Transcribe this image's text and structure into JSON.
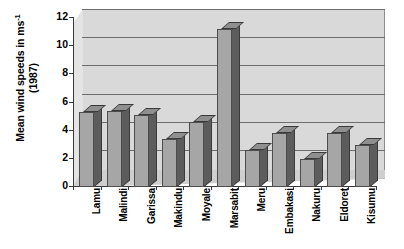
{
  "chart_data": {
    "type": "bar",
    "title": "",
    "subtitle": "",
    "xlabel": "",
    "ylabel": "Mean wind speeds in ms-1 (1987)",
    "ylabel_parts": {
      "main": "Mean wind speeds in ms",
      "superscript": "-1",
      "second_line": "(1987)"
    },
    "categories": [
      "Lamu",
      "Malindi",
      "Garissa",
      "Makindu",
      "Moyale",
      "Marsabit",
      "Meru",
      "Embakasi",
      "Nakuru",
      "Eldoret",
      "Kisumu"
    ],
    "values": [
      5.3,
      5.4,
      5.1,
      3.4,
      4.6,
      11.2,
      2.6,
      3.8,
      2.0,
      3.8,
      3.0
    ],
    "ylim": [
      0,
      12
    ],
    "ytick_values": [
      0,
      2,
      4,
      6,
      8,
      10,
      12
    ],
    "ytick_labels": [
      "0",
      "2",
      "4",
      "6",
      "8",
      "10",
      "12"
    ],
    "grid": true,
    "grid_axis": "y",
    "legend": false,
    "legend_position": "none",
    "style": "3d-column",
    "colors": {
      "bar_front": "#a6a6a6",
      "bar_side": "#5c5c5c",
      "bar_top": "#8f8f8f",
      "plot_background": "#d9d9d9",
      "floor": "#cfcfcf",
      "gridline": "#6e6e6e",
      "axis": "#3a3a3a",
      "text": "#000000",
      "page_background": "#ffffff"
    }
  }
}
